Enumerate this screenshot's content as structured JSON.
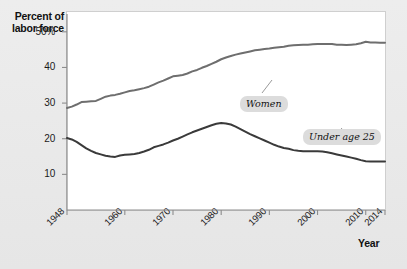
{
  "chart_data": {
    "type": "line",
    "title": "",
    "xlabel": "Year",
    "ylabel": "Percent of labor force",
    "xlim": [
      1948,
      2014
    ],
    "ylim": [
      0,
      55
    ],
    "grid": false,
    "legend_position": "inline-callouts",
    "xticks": [
      1948,
      1960,
      1970,
      1980,
      1990,
      2000,
      2010,
      2014
    ],
    "xtick_labels": [
      "1948",
      "1960",
      "1970",
      "1980",
      "1990",
      "2000",
      "2010",
      "2014"
    ],
    "yticks": [
      10,
      20,
      30,
      40,
      50
    ],
    "ytick_labels": [
      "10",
      "20",
      "30",
      "40",
      "50%"
    ],
    "series": [
      {
        "name": "Women",
        "color": "#6e6e6e",
        "label_text": "Women",
        "x": [
          1948,
          1949,
          1950,
          1951,
          1952,
          1953,
          1954,
          1955,
          1956,
          1957,
          1958,
          1959,
          1960,
          1961,
          1962,
          1963,
          1964,
          1965,
          1966,
          1967,
          1968,
          1969,
          1970,
          1971,
          1972,
          1973,
          1974,
          1975,
          1976,
          1977,
          1978,
          1979,
          1980,
          1981,
          1982,
          1983,
          1984,
          1985,
          1986,
          1987,
          1988,
          1989,
          1990,
          1991,
          1992,
          1993,
          1994,
          1995,
          1996,
          1997,
          1998,
          1999,
          2000,
          2001,
          2002,
          2003,
          2004,
          2005,
          2006,
          2007,
          2008,
          2009,
          2010,
          2011,
          2012,
          2013,
          2014
        ],
        "values": [
          28.6,
          29.0,
          29.6,
          30.3,
          30.4,
          30.5,
          30.6,
          31.2,
          31.8,
          32.1,
          32.3,
          32.6,
          33.0,
          33.4,
          33.6,
          33.9,
          34.2,
          34.6,
          35.2,
          35.8,
          36.3,
          36.9,
          37.5,
          37.7,
          37.9,
          38.3,
          38.9,
          39.3,
          39.9,
          40.4,
          41.0,
          41.6,
          42.3,
          42.8,
          43.2,
          43.6,
          43.9,
          44.2,
          44.5,
          44.8,
          45.0,
          45.2,
          45.3,
          45.5,
          45.7,
          45.8,
          46.1,
          46.2,
          46.3,
          46.4,
          46.4,
          46.5,
          46.6,
          46.6,
          46.6,
          46.6,
          46.4,
          46.4,
          46.3,
          46.4,
          46.5,
          46.8,
          47.2,
          47.0,
          47.0,
          46.9,
          46.9
        ]
      },
      {
        "name": "Under age 25",
        "color": "#3a3a3a",
        "label_text": "Under age 25",
        "x": [
          1948,
          1949,
          1950,
          1951,
          1952,
          1953,
          1954,
          1955,
          1956,
          1957,
          1958,
          1959,
          1960,
          1961,
          1962,
          1963,
          1964,
          1965,
          1966,
          1967,
          1968,
          1969,
          1970,
          1971,
          1972,
          1973,
          1974,
          1975,
          1976,
          1977,
          1978,
          1979,
          1980,
          1981,
          1982,
          1983,
          1984,
          1985,
          1986,
          1987,
          1988,
          1989,
          1990,
          1991,
          1992,
          1993,
          1994,
          1995,
          1996,
          1997,
          1998,
          1999,
          2000,
          2001,
          2002,
          2003,
          2004,
          2005,
          2006,
          2007,
          2008,
          2009,
          2010,
          2011,
          2012,
          2013,
          2014
        ],
        "values": [
          20.2,
          19.8,
          19.1,
          18.2,
          17.3,
          16.6,
          16.0,
          15.6,
          15.2,
          15.0,
          14.9,
          15.3,
          15.5,
          15.6,
          15.7,
          16.0,
          16.4,
          16.9,
          17.6,
          18.0,
          18.4,
          18.9,
          19.5,
          20.0,
          20.6,
          21.2,
          21.8,
          22.3,
          22.8,
          23.3,
          23.8,
          24.2,
          24.4,
          24.3,
          24.0,
          23.4,
          22.7,
          22.0,
          21.3,
          20.7,
          20.1,
          19.5,
          18.9,
          18.3,
          17.8,
          17.4,
          17.2,
          16.8,
          16.6,
          16.5,
          16.5,
          16.5,
          16.5,
          16.4,
          16.2,
          15.9,
          15.6,
          15.3,
          15.0,
          14.7,
          14.4,
          14.0,
          13.7,
          13.6,
          13.6,
          13.6,
          13.6
        ]
      }
    ],
    "annotations": [
      {
        "text": "Women",
        "x": 1993,
        "y": 40.0
      },
      {
        "text": "Under age 25",
        "x": 2006,
        "y": 28.5
      }
    ]
  },
  "axes": {
    "y_title_line1": "Percent of",
    "y_title_line2": "labor force",
    "x_title": "Year"
  },
  "colors": {
    "background": "#e9e9e9",
    "plot_background": "#ffffff",
    "plot_border": "#cfcfcf",
    "axis": "#808080",
    "women_line": "#6e6e6e",
    "under25_line": "#3a3a3a",
    "callout_background": "#dcdcdc",
    "text": "#111111"
  }
}
